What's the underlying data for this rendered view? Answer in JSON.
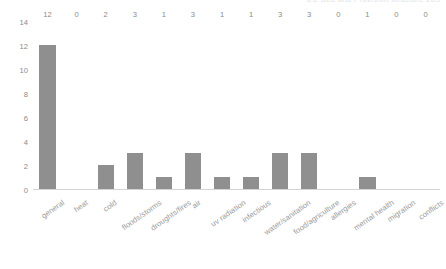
{
  "page": {
    "header_remnant": "6.2  Bed and Provision structure    203"
  },
  "chart_data": {
    "type": "bar",
    "title": "",
    "subtitle": "",
    "xlabel": "",
    "ylabel": "",
    "ylim": [
      0,
      14
    ],
    "yticks": [
      0,
      2,
      4,
      6,
      8,
      10,
      12,
      14
    ],
    "ytick_labels": [
      "0",
      "2",
      "4",
      "6",
      "8",
      "10",
      "12",
      "14"
    ],
    "grid": false,
    "legend": null,
    "bar_color": "#8f8f8f",
    "axis_color": "#d3d3d3",
    "label_color": "#8a8a8a",
    "show_value_labels": true,
    "categories": [
      "general",
      "heat",
      "cold",
      "floods/storms",
      "droughts/fires",
      "air",
      "uv radiation",
      "infectious",
      "water/sanitation",
      "food/agriculture",
      "allergies",
      "mental health",
      "migration",
      "conflicts"
    ],
    "values": [
      12,
      0,
      2,
      3,
      1,
      3,
      1,
      1,
      3,
      3,
      0,
      1,
      0,
      0
    ],
    "value_labels": [
      "12",
      "0",
      "2",
      "3",
      "1",
      "3",
      "1",
      "1",
      "3",
      "3",
      "0",
      "1",
      "0",
      "0"
    ]
  }
}
